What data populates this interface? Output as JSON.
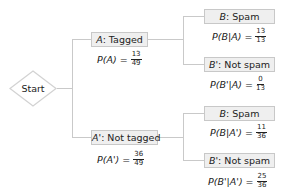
{
  "start": {
    "label": "Start"
  },
  "level1": [
    {
      "event_symbol": "A",
      "event_label": ": Tagged",
      "prob_expr": "P(A) =",
      "prob_num": "13",
      "prob_den": "49",
      "children": [
        {
          "event_symbol": "B",
          "event_label": ": Spam",
          "prob_expr": "P(B|A) =",
          "prob_num": "13",
          "prob_den": "13"
        },
        {
          "event_symbol": "B'",
          "event_label": ": Not spam",
          "prob_expr": "P(B'|A) =",
          "prob_num": "0",
          "prob_den": "13"
        }
      ]
    },
    {
      "event_symbol": "A'",
      "event_label": ": Not tagged",
      "prob_expr": "P(A') =",
      "prob_num": "36",
      "prob_den": "49",
      "children": [
        {
          "event_symbol": "B",
          "event_label": ": Spam",
          "prob_expr": "P(B|A') =",
          "prob_num": "11",
          "prob_den": "36"
        },
        {
          "event_symbol": "B'",
          "event_label": ": Not spam",
          "prob_expr": "P(B'|A') =",
          "prob_num": "25",
          "prob_den": "36"
        }
      ]
    }
  ],
  "colors": {
    "box_fill": "#efefef",
    "box_border": "#c8c8c8",
    "connector": "#c9c9c9",
    "text": "#222222"
  }
}
